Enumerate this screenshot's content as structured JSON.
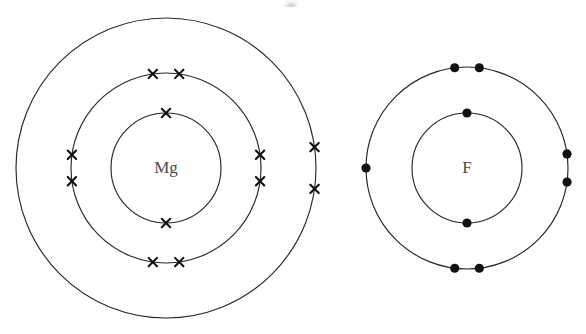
{
  "figure": {
    "background_color": "#ffffff",
    "line_color": "#272727",
    "electron_color": "#111111",
    "label_color": "#4a4a4a"
  },
  "atoms": [
    {
      "id": "magnesium",
      "symbol": "Mg",
      "electron_marker": "cross",
      "center": {
        "x": 166,
        "y": 168
      },
      "shells": [
        {
          "index": 1,
          "name": "inner-shell",
          "radius": 55,
          "electron_count": 2,
          "electron_angles": [
            270,
            90
          ]
        },
        {
          "index": 2,
          "name": "middle-shell",
          "radius": 95,
          "electron_count": 8,
          "electron_angles": [
            262,
            278,
            82,
            98,
            172,
            188,
            352,
            8
          ]
        },
        {
          "index": 3,
          "name": "outer-shell",
          "radius": 150,
          "electron_count": 2,
          "electron_angles": [
            352,
            8
          ]
        }
      ],
      "total_electrons": 12
    },
    {
      "id": "fluorine",
      "symbol": "F",
      "electron_marker": "dot",
      "center": {
        "x": 467,
        "y": 168
      },
      "shells": [
        {
          "index": 1,
          "name": "inner-shell",
          "radius": 55,
          "electron_count": 2,
          "electron_angles": [
            270,
            90
          ]
        },
        {
          "index": 2,
          "name": "outer-shell",
          "radius": 101,
          "electron_count": 7,
          "electron_angles": [
            263,
            277,
            83,
            97,
            352,
            8,
            180
          ]
        }
      ],
      "total_electrons": 9
    }
  ],
  "chart_data": {
    "type": "diagram",
    "title": "",
    "subtitle": "",
    "diagram_kind": "electron-shell-dot-and-cross",
    "series": [
      {
        "name": "Mg",
        "marker": "cross",
        "categories": [
          "shell 1",
          "shell 2",
          "shell 3"
        ],
        "values": [
          2,
          8,
          2
        ],
        "total": 12
      },
      {
        "name": "F",
        "marker": "dot",
        "categories": [
          "shell 1",
          "shell 2"
        ],
        "values": [
          2,
          7
        ],
        "total": 9
      }
    ],
    "annotations": [
      "Mg",
      "F"
    ]
  }
}
